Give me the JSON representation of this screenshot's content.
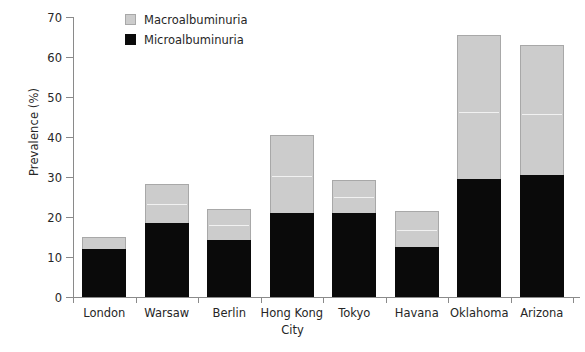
{
  "chart_data": {
    "type": "bar",
    "stacked": true,
    "title": "",
    "xlabel": "City",
    "ylabel": "Prevalence (%)",
    "ylim": [
      0,
      70
    ],
    "yticks": [
      0,
      10,
      20,
      30,
      40,
      50,
      60,
      70
    ],
    "grid": false,
    "legend_position": "top-left-inside",
    "categories": [
      "London",
      "Warsaw",
      "Berlin",
      "Hong Kong",
      "Tokyo",
      "Havana",
      "Oklahoma",
      "Arizona"
    ],
    "series": [
      {
        "name": "Microalbuminuria",
        "color": "#0a0a0a",
        "values": [
          11.9,
          18.5,
          14.2,
          21.0,
          21.0,
          12.6,
          29.5,
          30.5
        ]
      },
      {
        "name": "Macroalbuminuria",
        "color": "#cccccc",
        "values": [
          3.0,
          9.7,
          7.8,
          19.5,
          8.3,
          8.9,
          36.0,
          32.5
        ]
      }
    ],
    "totals": [
      14.9,
      28.2,
      22.0,
      40.5,
      29.3,
      21.5,
      65.5,
      63.0
    ]
  },
  "legend": {
    "entries": [
      {
        "label": "Macroalbuminuria",
        "swatch": "gray-square-swatch"
      },
      {
        "label": "Microalbuminuria",
        "swatch": "black-square-swatch"
      }
    ]
  },
  "axes": {
    "y_title": "Prevalence (%)",
    "x_title": "City",
    "y_tick_labels": [
      "70",
      "60",
      "50",
      "40",
      "30",
      "20",
      "10",
      "0"
    ],
    "x_tick_labels": [
      "London",
      "Warsaw",
      "Berlin",
      "Hong Kong",
      "Tokyo",
      "Havana",
      "Oklahoma",
      "Arizona"
    ]
  },
  "colors": {
    "macro": "#cccccc",
    "micro": "#0a0a0a",
    "axis": "#8a8a8a",
    "text": "#262626",
    "background": "#ffffff"
  }
}
